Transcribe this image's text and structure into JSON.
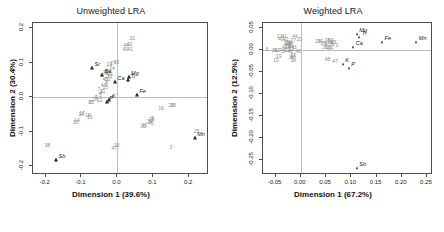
{
  "figure": {
    "width": 444,
    "height": 232,
    "background": "#ffffff",
    "marker_color": "#262626",
    "sample_label_color": "#8a8a8a",
    "axis_color": "#4d4d4d",
    "guide_color": "#bdbdbd"
  },
  "chart_data": [
    {
      "type": "scatter",
      "id": "unweighted-lra",
      "title": "Unweighted LRA",
      "xlabel": "Dimension 1 (39.6%)",
      "ylabel": "Dimension 2 (30.4%)",
      "xlim": [
        -0.235,
        0.255
      ],
      "ylim": [
        -0.225,
        0.215
      ],
      "xticks": [
        -0.2,
        -0.1,
        0.0,
        0.1,
        0.2
      ],
      "xticklabels": [
        "-0.2",
        "-0.1",
        "0.0",
        "0.1",
        "0.2"
      ],
      "yticks": [
        -0.2,
        -0.1,
        0.0,
        0.1,
        0.2
      ],
      "yticklabels": [
        "-0.2",
        "-0.1",
        "0.0",
        "0.1",
        "0.2"
      ],
      "grid": false,
      "guides": {
        "x": 0.0,
        "y": 0.0
      },
      "legend": "none",
      "variance_explained_pct": {
        "dim1": 39.6,
        "dim2": 30.4
      },
      "series": [
        {
          "name": "elements",
          "marker": "filled-triangle",
          "points": [
            {
              "label": "Sr",
              "x": -0.068,
              "y": 0.082
            },
            {
              "label": "Ba",
              "x": -0.04,
              "y": 0.062
            },
            {
              "label": "Ca",
              "x": -0.004,
              "y": 0.04
            },
            {
              "label": "Mg",
              "x": 0.034,
              "y": 0.057
            },
            {
              "label": "Ti",
              "x": 0.032,
              "y": 0.046
            },
            {
              "label": "Fe",
              "x": 0.057,
              "y": 0.004
            },
            {
              "label": "Mn",
              "x": 0.218,
              "y": -0.122
            },
            {
              "label": "Sb",
              "x": -0.168,
              "y": -0.184
            },
            {
              "label": "K",
              "x": -0.02,
              "y": -0.012
            },
            {
              "label": "P",
              "x": -0.027,
              "y": -0.016
            }
          ]
        },
        {
          "name": "samples",
          "marker": "text-number",
          "points": [
            {
              "label": "31",
              "x": 0.044,
              "y": 0.17
            },
            {
              "label": "44",
              "x": 0.027,
              "y": 0.147
            },
            {
              "label": "42",
              "x": 0.037,
              "y": 0.151
            },
            {
              "label": "40",
              "x": 0.025,
              "y": 0.138
            },
            {
              "label": "41",
              "x": 0.038,
              "y": 0.137
            },
            {
              "label": "23",
              "x": -0.02,
              "y": 0.093
            },
            {
              "label": "27",
              "x": -0.01,
              "y": 0.096
            },
            {
              "label": "30",
              "x": 0.0,
              "y": 0.098
            },
            {
              "label": "24",
              "x": -0.012,
              "y": 0.083
            },
            {
              "label": "29",
              "x": -0.03,
              "y": 0.071
            },
            {
              "label": "37",
              "x": -0.024,
              "y": 0.068
            },
            {
              "label": "21",
              "x": -0.017,
              "y": 0.064
            },
            {
              "label": "22",
              "x": -0.019,
              "y": 0.058
            },
            {
              "label": "45",
              "x": -0.031,
              "y": 0.05
            },
            {
              "label": "32",
              "x": -0.024,
              "y": 0.051
            },
            {
              "label": "43",
              "x": -0.036,
              "y": 0.034
            },
            {
              "label": "8",
              "x": -0.027,
              "y": 0.038
            },
            {
              "label": "13",
              "x": -0.031,
              "y": 0.028
            },
            {
              "label": "7",
              "x": -0.049,
              "y": 0.022
            },
            {
              "label": "1",
              "x": -0.041,
              "y": 0.016
            },
            {
              "label": "11",
              "x": -0.038,
              "y": 0.014
            },
            {
              "label": "4",
              "x": -0.046,
              "y": 0.009
            },
            {
              "label": "2",
              "x": -0.044,
              "y": 0.003
            },
            {
              "label": "5",
              "x": -0.056,
              "y": -0.002
            },
            {
              "label": "20",
              "x": -0.06,
              "y": -0.008
            },
            {
              "label": "12",
              "x": -0.047,
              "y": -0.012
            },
            {
              "label": "35",
              "x": -0.07,
              "y": -0.016
            },
            {
              "label": "6",
              "x": -0.074,
              "y": -0.018
            },
            {
              "label": "17",
              "x": -0.096,
              "y": -0.048
            },
            {
              "label": "19",
              "x": -0.098,
              "y": -0.052
            },
            {
              "label": "18",
              "x": -0.08,
              "y": -0.054
            },
            {
              "label": "14",
              "x": -0.11,
              "y": -0.068
            },
            {
              "label": "10",
              "x": -0.113,
              "y": -0.074
            },
            {
              "label": "38",
              "x": -0.192,
              "y": -0.14
            },
            {
              "label": "34",
              "x": 0.0,
              "y": -0.141
            },
            {
              "label": "47",
              "x": -0.006,
              "y": -0.15
            },
            {
              "label": "3",
              "x": 0.152,
              "y": -0.148
            },
            {
              "label": "25",
              "x": 0.224,
              "y": -0.101
            },
            {
              "label": "16",
              "x": 0.124,
              "y": -0.034
            },
            {
              "label": "28",
              "x": 0.153,
              "y": -0.026
            },
            {
              "label": "33",
              "x": 0.158,
              "y": -0.025
            },
            {
              "label": "9",
              "x": 0.101,
              "y": -0.062
            },
            {
              "label": "26",
              "x": 0.098,
              "y": -0.066
            },
            {
              "label": "39",
              "x": 0.092,
              "y": -0.073
            },
            {
              "label": "46",
              "x": 0.096,
              "y": -0.078
            },
            {
              "label": "15",
              "x": 0.078,
              "y": -0.083
            },
            {
              "label": "36",
              "x": 0.074,
              "y": -0.087
            },
            {
              "label": "15b",
              "x": -0.074,
              "y": -0.06
            }
          ]
        }
      ]
    },
    {
      "type": "scatter",
      "id": "weighted-lra",
      "title": "Weighted LRA",
      "xlabel": "Dimension 1 (67.2%)",
      "ylabel": "Dimension 2 (12.5%)",
      "xlim": [
        -0.075,
        0.262
      ],
      "ylim": [
        -0.285,
        0.062
      ],
      "xticks": [
        -0.05,
        0.0,
        0.05,
        0.1,
        0.15,
        0.2,
        0.25
      ],
      "xticklabels": [
        "-0.05",
        "0.00",
        "0.05",
        "0.10",
        "0.15",
        "0.20",
        "0.25"
      ],
      "yticks": [
        -0.25,
        -0.2,
        -0.15,
        -0.1,
        -0.05,
        0.0,
        0.05
      ],
      "yticklabels": [
        "-0.25",
        "-0.20",
        "-0.15",
        "-0.10",
        "-0.05",
        "0.00",
        "0.05"
      ],
      "grid": false,
      "guides": {
        "x": 0.0,
        "y": 0.0
      },
      "legend": "none",
      "variance_explained_pct": {
        "dim1": 67.2,
        "dim2": 12.5
      },
      "series": [
        {
          "name": "elements",
          "marker": "filled-triangle",
          "points": [
            {
              "label": "Mg",
              "x": 0.113,
              "y": 0.034
            },
            {
              "label": "Ti",
              "x": 0.118,
              "y": 0.028
            },
            {
              "label": "Fe",
              "x": 0.163,
              "y": 0.017
            },
            {
              "label": "Mn",
              "x": 0.231,
              "y": 0.017
            },
            {
              "label": "Ca",
              "x": 0.106,
              "y": 0.006
            },
            {
              "label": "K",
              "x": 0.085,
              "y": -0.033
            },
            {
              "label": "P",
              "x": 0.097,
              "y": -0.044
            },
            {
              "label": "Sb",
              "x": 0.113,
              "y": -0.272
            }
          ]
        },
        {
          "name": "samples",
          "marker": "text-number",
          "points": [
            {
              "label": "31",
              "x": -0.04,
              "y": 0.029
            },
            {
              "label": "41",
              "x": -0.031,
              "y": 0.03
            },
            {
              "label": "44",
              "x": -0.01,
              "y": 0.031
            },
            {
              "label": "40",
              "x": -0.038,
              "y": 0.023
            },
            {
              "label": "42",
              "x": -0.029,
              "y": 0.023
            },
            {
              "label": "27",
              "x": -0.013,
              "y": 0.022
            },
            {
              "label": "20",
              "x": -0.001,
              "y": 0.024
            },
            {
              "label": "23",
              "x": -0.024,
              "y": 0.016
            },
            {
              "label": "32",
              "x": -0.027,
              "y": 0.014
            },
            {
              "label": "29",
              "x": -0.022,
              "y": 0.013
            },
            {
              "label": "37",
              "x": -0.019,
              "y": 0.012
            },
            {
              "label": "21",
              "x": -0.017,
              "y": 0.009
            },
            {
              "label": "22",
              "x": -0.024,
              "y": 0.007
            },
            {
              "label": "45",
              "x": -0.03,
              "y": 0.006
            },
            {
              "label": "8",
              "x": -0.02,
              "y": 0.004
            },
            {
              "label": "43",
              "x": -0.012,
              "y": 0.004
            },
            {
              "label": "13",
              "x": -0.017,
              "y": 0.0
            },
            {
              "label": "7",
              "x": -0.038,
              "y": -0.002
            },
            {
              "label": "1",
              "x": -0.03,
              "y": -0.003
            },
            {
              "label": "11",
              "x": -0.026,
              "y": -0.003
            },
            {
              "label": "4",
              "x": -0.021,
              "y": -0.004
            },
            {
              "label": "2",
              "x": -0.016,
              "y": -0.005
            },
            {
              "label": "5",
              "x": -0.034,
              "y": -0.004
            },
            {
              "label": "12",
              "x": -0.045,
              "y": -0.003
            },
            {
              "label": "35",
              "x": -0.05,
              "y": -0.002
            },
            {
              "label": "6",
              "x": -0.065,
              "y": 0.0
            },
            {
              "label": "46",
              "x": -0.003,
              "y": -0.004
            },
            {
              "label": "17",
              "x": -0.014,
              "y": -0.014
            },
            {
              "label": "19",
              "x": -0.042,
              "y": -0.016
            },
            {
              "label": "18",
              "x": -0.017,
              "y": -0.017
            },
            {
              "label": "14",
              "x": -0.013,
              "y": -0.015
            },
            {
              "label": "10",
              "x": -0.047,
              "y": -0.024
            },
            {
              "label": "38",
              "x": -0.013,
              "y": -0.024
            },
            {
              "label": "24",
              "x": 0.036,
              "y": 0.018
            },
            {
              "label": "30",
              "x": 0.041,
              "y": 0.019
            },
            {
              "label": "28",
              "x": 0.055,
              "y": 0.021
            },
            {
              "label": "33",
              "x": 0.061,
              "y": 0.022
            },
            {
              "label": "16",
              "x": 0.059,
              "y": 0.016
            },
            {
              "label": "25",
              "x": 0.067,
              "y": 0.016
            },
            {
              "label": "26",
              "x": 0.047,
              "y": 0.013
            },
            {
              "label": "9",
              "x": 0.052,
              "y": 0.012
            },
            {
              "label": "39",
              "x": 0.063,
              "y": 0.011
            },
            {
              "label": "3",
              "x": 0.073,
              "y": 0.01
            },
            {
              "label": "15",
              "x": 0.056,
              "y": 0.006
            },
            {
              "label": "36",
              "x": 0.05,
              "y": 0.004
            },
            {
              "label": "34",
              "x": 0.06,
              "y": 0.002
            },
            {
              "label": "47",
              "x": 0.07,
              "y": -0.028
            },
            {
              "label": "48",
              "x": 0.055,
              "y": -0.022
            }
          ]
        }
      ]
    }
  ]
}
